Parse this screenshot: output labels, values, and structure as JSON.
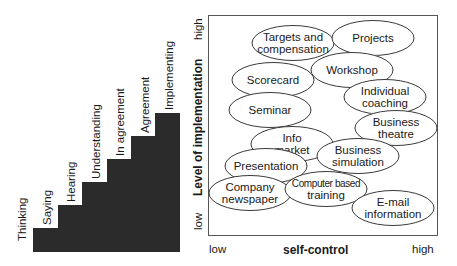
{
  "staircase": {
    "steps": [
      {
        "label": "Thinking",
        "left": 33,
        "top": 228
      },
      {
        "label": "Saying",
        "left": 58,
        "top": 205
      },
      {
        "label": "Hearing",
        "left": 82,
        "top": 182
      },
      {
        "label": "Understanding",
        "left": 107,
        "top": 159
      },
      {
        "label": "In agreement",
        "left": 131,
        "top": 136
      },
      {
        "label": "Agreement",
        "left": 155,
        "top": 113
      },
      {
        "label": "Implementing",
        "left": 155,
        "top": 113
      }
    ],
    "labels": [
      "Thinking",
      "Saying",
      "Hearing",
      "Understanding",
      "In agreement",
      "Agreement",
      "Implementing"
    ],
    "fill_color": "#2b2b2b"
  },
  "matrix": {
    "x_axis": {
      "title": "self-control",
      "low": "low",
      "high": "high"
    },
    "y_axis": {
      "title": "Level of implementation",
      "low": "low",
      "high": "high"
    },
    "bubbles": [
      {
        "lines": [
          "Targets and",
          "compensation"
        ],
        "cx": 293,
        "cy": 43
      },
      {
        "lines": [
          "Projects"
        ],
        "cx": 373,
        "cy": 38
      },
      {
        "lines": [
          "Workshop"
        ],
        "cx": 352,
        "cy": 70
      },
      {
        "lines": [
          "Scorecard"
        ],
        "cx": 273,
        "cy": 80
      },
      {
        "lines": [
          "Individual",
          "coaching"
        ],
        "cx": 385,
        "cy": 97
      },
      {
        "lines": [
          "Seminar"
        ],
        "cx": 270,
        "cy": 110
      },
      {
        "lines": [
          "Business",
          "theatre"
        ],
        "cx": 396,
        "cy": 128
      },
      {
        "lines": [
          "Info",
          "market"
        ],
        "cx": 292,
        "cy": 144
      },
      {
        "lines": [
          "Business",
          "simulation"
        ],
        "cx": 358,
        "cy": 156
      },
      {
        "lines": [
          "Presentation"
        ],
        "cx": 266,
        "cy": 166
      },
      {
        "lines": [
          "Company",
          "newspaper"
        ],
        "cx": 250,
        "cy": 193
      },
      {
        "lines": [
          "Computer based",
          "training"
        ],
        "cx": 326,
        "cy": 189
      },
      {
        "lines": [
          "E-mail",
          "information"
        ],
        "cx": 393,
        "cy": 208
      }
    ]
  }
}
